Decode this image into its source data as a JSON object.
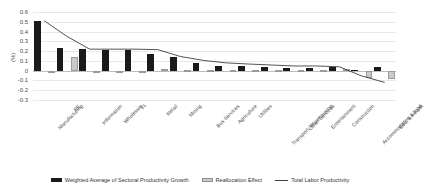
{
  "chart_data": {
    "type": "bar",
    "title": "",
    "xlabel": "",
    "ylabel": "(%)",
    "ylim": [
      -0.3,
      0.6
    ],
    "yticks": [
      "0.6",
      "0.5",
      "0.4",
      "0.3",
      "0.2",
      "0.1",
      "0",
      "-0.1",
      "-0.2",
      "-0.3"
    ],
    "grid": true,
    "legend_position": "bottom",
    "categories": [
      "Manufacturing",
      "RE",
      "Information",
      "Wholesale",
      "FI",
      "Retail",
      "Mining",
      "Bus Services",
      "Agriculture",
      "Utilities",
      "Transport, Warehousing",
      "Other Services",
      "Entertainment",
      "Construction",
      "Accommodation & food",
      "Edu. & Health"
    ],
    "series": [
      {
        "name": "Weighted Average of Sectoral Productivity Growth",
        "type": "bar",
        "color": "#1a1a1a",
        "values": [
          0.51,
          0.23,
          0.22,
          0.21,
          0.21,
          0.17,
          0.14,
          0.08,
          0.05,
          0.045,
          0.035,
          0.03,
          0.028,
          0.04,
          0.005,
          0.04
        ]
      },
      {
        "name": "Reallocation Effect",
        "type": "bar",
        "color": "#c9c9c9",
        "values": [
          -0.005,
          0.14,
          -0.008,
          -0.004,
          -0.006,
          0.022,
          0.008,
          0.004,
          0.002,
          0.002,
          0.002,
          0.002,
          0.002,
          0.012,
          -0.075,
          -0.085
        ]
      },
      {
        "name": "Total Labor Productivity",
        "type": "line",
        "color": "#404040",
        "values": [
          0.51,
          0.35,
          0.22,
          0.22,
          0.22,
          0.215,
          0.145,
          0.105,
          0.08,
          0.068,
          0.058,
          0.048,
          0.048,
          0.04,
          -0.055,
          -0.12
        ]
      }
    ]
  },
  "legend": {
    "items": [
      {
        "label": "Weighted Average of Sectoral Productivity Growth",
        "swatch": "dark-square-swatch"
      },
      {
        "label": "Reallocation Effect",
        "swatch": "light-square-swatch"
      },
      {
        "label": "Total Labor Productivity",
        "swatch": "line-swatch"
      }
    ]
  }
}
